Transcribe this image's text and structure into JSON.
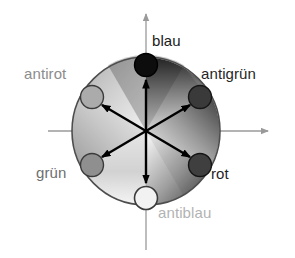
{
  "figure": {
    "background_color": "#ffffff"
  },
  "axes": {
    "x_axis": {
      "name": "horizontal-axis",
      "color": "#9a9a9a",
      "arrow": "right"
    },
    "y_axis": {
      "name": "vertical-axis",
      "color": "#9a9a9a",
      "arrow": "up"
    }
  },
  "disc": {
    "center": {
      "x": 146,
      "y": 131
    },
    "radius": 74,
    "outline_color": "#4d4d4d",
    "sector_count": 6
  },
  "nodes": [
    {
      "id": "blau",
      "label": "blau",
      "label_color": "#1a1a1a",
      "fill": "#0d0d0d",
      "stroke": "#000000",
      "angle_deg": 90,
      "cx": 146,
      "cy": 65,
      "r": 11
    },
    {
      "id": "antigruen",
      "label": "antigrün",
      "label_color": "#262626",
      "fill": "#3a3a3a",
      "stroke": "#161616",
      "angle_deg": 30,
      "cx": 200,
      "cy": 97,
      "r": 11
    },
    {
      "id": "rot",
      "label": "rot",
      "label_color": "#1f1f1f",
      "fill": "#3f3f3f",
      "stroke": "#141414",
      "angle_deg": -30,
      "cx": 200,
      "cy": 165,
      "r": 11
    },
    {
      "id": "antiblau",
      "label": "antiblau",
      "label_color": "#b3b3b3",
      "fill": "#f2f2f2",
      "stroke": "#3b3b3b",
      "angle_deg": -90,
      "cx": 146,
      "cy": 198,
      "r": 11
    },
    {
      "id": "gruen",
      "label": "grün",
      "label_color": "#6e6e6e",
      "fill": "#8f8f8f",
      "stroke": "#3a3a3a",
      "angle_deg": -150,
      "cx": 92,
      "cy": 165,
      "r": 11
    },
    {
      "id": "antirot",
      "label": "antirot",
      "label_color": "#8c8c8c",
      "fill": "#ababab",
      "stroke": "#3a3a3a",
      "angle_deg": 150,
      "cx": 92,
      "cy": 97,
      "r": 11
    }
  ],
  "arrows": {
    "color": "#000000",
    "count": 6,
    "origin": {
      "x": 146,
      "y": 131
    },
    "targets": [
      "blau",
      "antigrün",
      "rot",
      "antiblau",
      "grün",
      "antirot"
    ]
  },
  "labels": {
    "blau": "blau",
    "antirot": "antirot",
    "antigruen": "antigrün",
    "gruen": "grün",
    "rot": "rot",
    "antiblau": "antiblau"
  }
}
